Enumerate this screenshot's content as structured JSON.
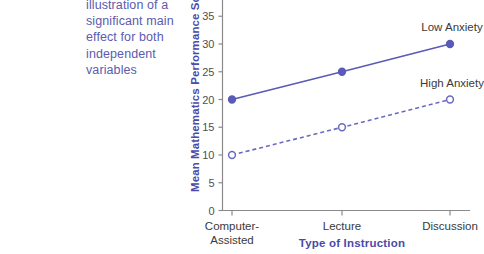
{
  "caption": {
    "lines": [
      "illustration of a",
      "significant main",
      "effect for both",
      "independent",
      "variables"
    ],
    "color": "#5b5bae"
  },
  "chart_data": {
    "type": "line",
    "title": "",
    "xlabel": "Type of Instruction",
    "ylabel": "Mean Mathematics Performance Score",
    "categories": [
      "Computer-Assisted",
      "Lecture",
      "Discussion"
    ],
    "category_label_lines": [
      [
        "Computer-",
        "Assisted"
      ],
      [
        "Lecture"
      ],
      [
        "Discussion"
      ]
    ],
    "series": [
      {
        "name": "Low Anxiety",
        "values": [
          20,
          25,
          30
        ],
        "style": "solid",
        "marker": "filled-circle",
        "color": "#5a5ab8"
      },
      {
        "name": "High Anxiety",
        "values": [
          10,
          15,
          20
        ],
        "style": "dashed",
        "marker": "open-circle",
        "color": "#6a6ac0"
      }
    ],
    "yticks": [
      0,
      5,
      10,
      15,
      20,
      25,
      30,
      35
    ],
    "ytick_labels": [
      "0",
      "5",
      "10",
      "15",
      "20",
      "25",
      "30",
      "35"
    ],
    "ylim": [
      0,
      38
    ],
    "grid": false,
    "legend_position": "inline-right",
    "axis_color": "#8a8a8a",
    "accent_color": "#4a4aa8"
  }
}
